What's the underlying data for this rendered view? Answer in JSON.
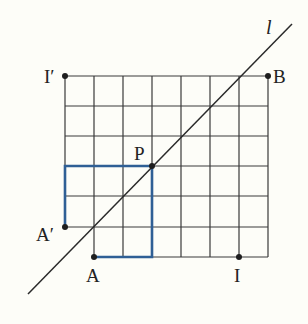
{
  "diagram": {
    "type": "grid-reflection",
    "grid": {
      "origin_x": 65,
      "origin_y": 76,
      "cell": 29.5,
      "cols": 7,
      "rows": 6,
      "missing_cells": [
        {
          "col": 0,
          "row": 5
        }
      ]
    },
    "line": {
      "label": "l",
      "from": [
        28,
        294
      ],
      "to": [
        292,
        24
      ]
    },
    "points": {
      "I_prime": {
        "label": "I′",
        "grid": [
          0,
          0
        ]
      },
      "B": {
        "label": "B",
        "grid": [
          7,
          0
        ]
      },
      "P": {
        "label": "P",
        "grid": [
          3,
          3
        ]
      },
      "A_prime": {
        "label": "A′",
        "grid": [
          0,
          5
        ]
      },
      "A": {
        "label": "A",
        "grid": [
          1,
          6
        ]
      },
      "I": {
        "label": "I",
        "grid": [
          6,
          6
        ]
      }
    },
    "highlight_paths": [
      "A'-(0,3)-P",
      "A-(3,6)-P"
    ],
    "colors": {
      "grid": "#3a3a3a",
      "highlight": "#2f5f95",
      "line": "#2a2a2a"
    }
  }
}
